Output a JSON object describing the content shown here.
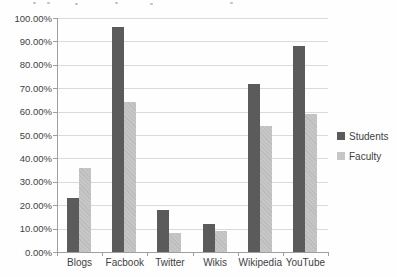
{
  "chart_data": {
    "type": "bar",
    "title": "",
    "categories": [
      "Blogs",
      "Facbook",
      "Twitter",
      "Wikis",
      "Wikipedia",
      "YouTube"
    ],
    "series": [
      {
        "name": "Students",
        "color": "#5b5b5b",
        "values": [
          23,
          96,
          18,
          12,
          72,
          88
        ]
      },
      {
        "name": "Faculty",
        "color": "#c6c6c6",
        "values": [
          36,
          64,
          8,
          9,
          54,
          59
        ]
      }
    ],
    "xlabel": "",
    "ylabel": "",
    "ylim": [
      0,
      100
    ],
    "y_tick_step": 10,
    "y_tick_labels": [
      "0.00%",
      "10.00%",
      "20.00%",
      "30.00%",
      "40.00%",
      "50.00%",
      "60.00%",
      "70.00%",
      "80.00%",
      "90.00%",
      "100.00%"
    ],
    "grid": true,
    "legend_position": "right"
  },
  "colors": {
    "gridline": "#dadada",
    "axis": "#9f9f9f",
    "text": "#3f3f3f"
  }
}
